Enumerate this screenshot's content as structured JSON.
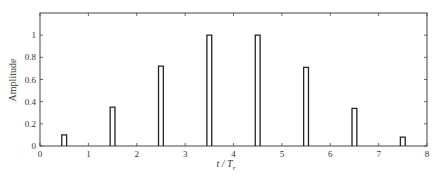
{
  "chart_data": {
    "type": "bar",
    "title": "",
    "xlabel": "t / T_r",
    "xlabel_main": "t / T",
    "xlabel_sub": "r",
    "ylabel": "Amplitude",
    "xlim": [
      0,
      8
    ],
    "ylim": [
      0,
      1.2
    ],
    "xticks": [
      0,
      1,
      2,
      3,
      4,
      5,
      6,
      7,
      8
    ],
    "yticks": [
      0,
      0.2,
      0.4,
      0.6,
      0.8,
      1
    ],
    "ytick_labels": [
      "0",
      "0.2",
      "0.4",
      "0.6",
      "0.8",
      "1"
    ],
    "grid": false,
    "legend": null,
    "pulse_width": 0.1,
    "x": [
      0.5,
      1.5,
      2.5,
      3.5,
      4.5,
      5.5,
      6.5,
      7.5
    ],
    "values": [
      0.1,
      0.35,
      0.72,
      1.0,
      1.0,
      0.71,
      0.34,
      0.08
    ],
    "style": "outlined rectangular pulses"
  }
}
